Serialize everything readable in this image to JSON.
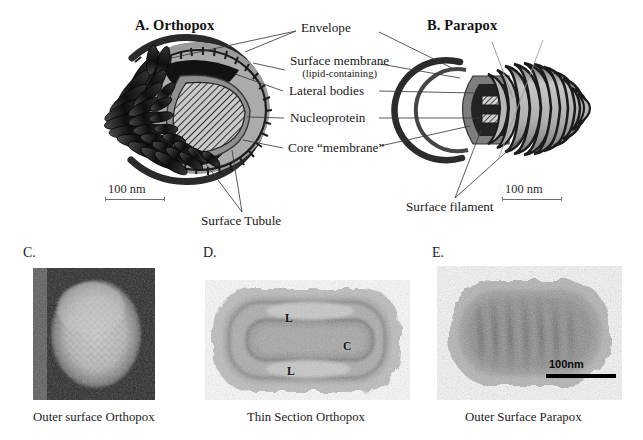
{
  "figure": {
    "width": 643,
    "height": 440,
    "background": "#ffffff"
  },
  "diagram_panels": [
    {
      "id": "A",
      "title": "A. Orthopox",
      "scale_bar_label": "100 nm"
    },
    {
      "id": "B",
      "title": "B. Parapox",
      "scale_bar_label": "100 nm"
    }
  ],
  "callouts": {
    "envelope": "Envelope",
    "surface_membrane": "Surface membrane",
    "surface_membrane_sub": "(lipid-containing)",
    "lateral_bodies": "Lateral bodies",
    "nucleoprotein": "Nucleoprotein",
    "core_membrane": "Core “membrane”",
    "surface_tubule": "Surface Tubule",
    "surface_filament": "Surface filament"
  },
  "micrograph_panels": [
    {
      "letter": "C.",
      "caption": "Outer surface Orthopox",
      "tags": [],
      "scale_label": null
    },
    {
      "letter": "D.",
      "caption": "Thin Section Orthopox",
      "tags": [
        "L",
        "C",
        "L"
      ],
      "scale_label": null
    },
    {
      "letter": "E.",
      "caption": "Outer Surface Parapox",
      "tags": [],
      "scale_label": "100nm"
    }
  ],
  "colors": {
    "ink": "#1a1a1a",
    "leader_line": "#3a3a3a",
    "membrane_dark": "#2f2f2f",
    "core_mid_gray": "#8e8e8e",
    "core_light_gray": "#b9b9b9",
    "lateral_body_black": "#141414",
    "paper": "#ffffff"
  }
}
